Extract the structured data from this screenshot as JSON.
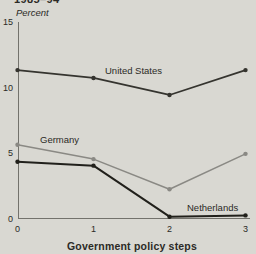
{
  "header": {
    "period": "1985–94",
    "unit_label": "Percent"
  },
  "colors": {
    "background": "#d9d8d2",
    "axis": "#73726c",
    "text": "#2b2a26"
  },
  "chart_data": {
    "type": "line",
    "title": "1985–94",
    "x": [
      0,
      1,
      2,
      3
    ],
    "xlabel": "Government policy steps",
    "ylabel": "Percent",
    "ylim": [
      0,
      15
    ],
    "yticks": [
      "0",
      "5",
      "10",
      "15"
    ],
    "xticks": [
      "0",
      "1",
      "2",
      "3"
    ],
    "grid": false,
    "legend": "inline-labels",
    "series": [
      {
        "name": "United States",
        "values": [
          11.3,
          10.7,
          9.4,
          11.3
        ],
        "color": "#35342f"
      },
      {
        "name": "Germany",
        "values": [
          5.6,
          4.5,
          2.2,
          4.9
        ],
        "color": "#8a8984"
      },
      {
        "name": "Netherlands",
        "values": [
          4.3,
          4.0,
          0.1,
          0.2
        ],
        "color": "#21201b"
      }
    ]
  }
}
